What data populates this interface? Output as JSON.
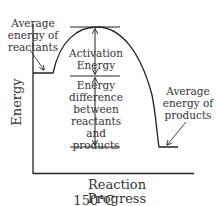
{
  "diagram": {
    "type": "energy-profile",
    "reactants_label": [
      "Average",
      "energy of",
      "reactants"
    ],
    "products_label": [
      "Average",
      "energy of",
      "products"
    ],
    "activation_label": [
      "Activation",
      "Energy"
    ],
    "difference_label": [
      "Energy",
      "difference",
      "between",
      "reactants and",
      "products"
    ],
    "y_axis_label": "Energy",
    "x_axis_label": "Reaction Progress",
    "temperature": "150°C",
    "colors": {
      "line": "#222222",
      "text": "#333333"
    }
  }
}
